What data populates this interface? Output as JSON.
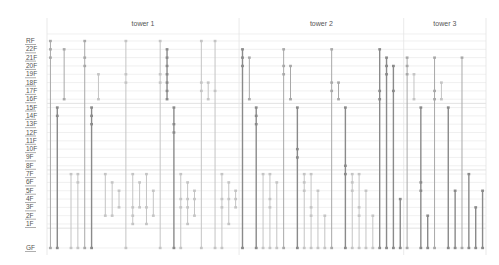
{
  "chart_data": {
    "type": "range-bar",
    "title": "",
    "xlabel": "",
    "ylabel": "",
    "y_categories": [
      "GF",
      "1F",
      "2F",
      "3F",
      "4F",
      "5F",
      "6F",
      "7F",
      "8F",
      "9F",
      "10F",
      "11F",
      "12F",
      "13F",
      "14F",
      "15F",
      "16F",
      "17F",
      "18F",
      "19F",
      "20F",
      "21F",
      "22F",
      "RF"
    ],
    "groups": [
      {
        "name": "tower 1",
        "columns": 28
      },
      {
        "name": "tower 2",
        "columns": 24
      },
      {
        "name": "tower 3",
        "columns": 12
      }
    ],
    "colors": {
      "dark": "#8a8a8a",
      "mid": "#a8a8a8",
      "light": "#c4c4c4"
    },
    "series": [
      {
        "group": 0,
        "from": 0,
        "to": 23,
        "stops": [
          22,
          21
        ],
        "tone": "mid"
      },
      {
        "group": 0,
        "from": 0,
        "to": 15,
        "stops": [
          14
        ],
        "tone": "dark"
      },
      {
        "group": 0,
        "from": 16,
        "to": 22,
        "stops": [],
        "tone": "mid"
      },
      {
        "group": 0,
        "from": 0,
        "to": 7,
        "stops": [],
        "tone": "light"
      },
      {
        "group": 0,
        "from": 0,
        "to": 7,
        "stops": [
          6
        ],
        "tone": "light"
      },
      {
        "group": 0,
        "from": 0,
        "to": 23,
        "stops": [
          21,
          20
        ],
        "tone": "mid"
      },
      {
        "group": 0,
        "from": 0,
        "to": 15,
        "stops": [
          14,
          13
        ],
        "tone": "dark"
      },
      {
        "group": 0,
        "from": 16,
        "to": 19,
        "stops": [],
        "tone": "light"
      },
      {
        "group": 0,
        "from": 2,
        "to": 7,
        "stops": [],
        "tone": "light"
      },
      {
        "group": 0,
        "from": 2,
        "to": 6,
        "stops": [],
        "tone": "light"
      },
      {
        "group": 0,
        "from": 3,
        "to": 5,
        "stops": [],
        "tone": "light"
      },
      {
        "group": 0,
        "from": 0,
        "to": 23,
        "stops": [
          19,
          18
        ],
        "tone": "light"
      },
      {
        "group": 0,
        "from": 1,
        "to": 7,
        "stops": [
          3,
          2
        ],
        "tone": "light"
      },
      {
        "group": 0,
        "from": 3,
        "to": 6,
        "stops": [],
        "tone": "light"
      },
      {
        "group": 0,
        "from": 1,
        "to": 7,
        "stops": [
          3
        ],
        "tone": "light"
      },
      {
        "group": 0,
        "from": 2,
        "to": 5,
        "stops": [],
        "tone": "light"
      },
      {
        "group": 0,
        "from": 0,
        "to": 23,
        "stops": [
          19,
          18
        ],
        "tone": "light"
      },
      {
        "group": 0,
        "from": 16,
        "to": 22,
        "stops": [
          21,
          20,
          19,
          18,
          17
        ],
        "tone": "dark"
      },
      {
        "group": 0,
        "from": 0,
        "to": 15,
        "stops": [
          13,
          12
        ],
        "tone": "dark"
      },
      {
        "group": 0,
        "from": 0,
        "to": 7,
        "stops": [
          4,
          3
        ],
        "tone": "light"
      },
      {
        "group": 0,
        "from": 1,
        "to": 6,
        "stops": [
          4,
          3
        ],
        "tone": "light"
      },
      {
        "group": 0,
        "from": 2,
        "to": 5,
        "stops": [
          4
        ],
        "tone": "light"
      },
      {
        "group": 0,
        "from": 0,
        "to": 23,
        "stops": [
          18,
          17
        ],
        "tone": "light"
      },
      {
        "group": 0,
        "from": 16,
        "to": 18,
        "stops": [],
        "tone": "light"
      },
      {
        "group": 0,
        "from": 0,
        "to": 23,
        "stops": [
          17
        ],
        "tone": "light"
      },
      {
        "group": 0,
        "from": 0,
        "to": 7,
        "stops": [
          4,
          3
        ],
        "tone": "light"
      },
      {
        "group": 0,
        "from": 1,
        "to": 6,
        "stops": [
          4
        ],
        "tone": "light"
      },
      {
        "group": 0,
        "from": 3,
        "to": 5,
        "stops": [
          4
        ],
        "tone": "light"
      },
      {
        "group": 1,
        "from": 0,
        "to": 22,
        "stops": [
          21,
          20
        ],
        "tone": "dark"
      },
      {
        "group": 1,
        "from": 16,
        "to": 21,
        "stops": [],
        "tone": "mid"
      },
      {
        "group": 1,
        "from": 0,
        "to": 15,
        "stops": [
          14,
          13
        ],
        "tone": "dark"
      },
      {
        "group": 1,
        "from": 0,
        "to": 7,
        "stops": [],
        "tone": "light"
      },
      {
        "group": 1,
        "from": 0,
        "to": 7,
        "stops": [
          4,
          3
        ],
        "tone": "light"
      },
      {
        "group": 1,
        "from": 0,
        "to": 6,
        "stops": [],
        "tone": "light"
      },
      {
        "group": 1,
        "from": 0,
        "to": 22,
        "stops": [
          20,
          19
        ],
        "tone": "mid"
      },
      {
        "group": 1,
        "from": 16,
        "to": 20,
        "stops": [],
        "tone": "mid"
      },
      {
        "group": 1,
        "from": 0,
        "to": 15,
        "stops": [
          10,
          9
        ],
        "tone": "dark"
      },
      {
        "group": 1,
        "from": 0,
        "to": 7,
        "stops": [
          6,
          5
        ],
        "tone": "light"
      },
      {
        "group": 1,
        "from": 0,
        "to": 7,
        "stops": [
          3,
          2
        ],
        "tone": "light"
      },
      {
        "group": 1,
        "from": 0,
        "to": 5,
        "stops": [],
        "tone": "light"
      },
      {
        "group": 1,
        "from": 0,
        "to": 2,
        "stops": [],
        "tone": "light"
      },
      {
        "group": 1,
        "from": 0,
        "to": 22,
        "stops": [
          18,
          17
        ],
        "tone": "mid"
      },
      {
        "group": 1,
        "from": 16,
        "to": 18,
        "stops": [],
        "tone": "mid"
      },
      {
        "group": 1,
        "from": 0,
        "to": 15,
        "stops": [
          8,
          7
        ],
        "tone": "dark"
      },
      {
        "group": 1,
        "from": 0,
        "to": 7,
        "stops": [
          6,
          5
        ],
        "tone": "light"
      },
      {
        "group": 1,
        "from": 0,
        "to": 7,
        "stops": [
          3,
          2
        ],
        "tone": "light"
      },
      {
        "group": 1,
        "from": 0,
        "to": 5,
        "stops": [],
        "tone": "light"
      },
      {
        "group": 1,
        "from": 0,
        "to": 2,
        "stops": [],
        "tone": "light"
      },
      {
        "group": 1,
        "from": 0,
        "to": 22,
        "stops": [
          17,
          16
        ],
        "tone": "dark"
      },
      {
        "group": 1,
        "from": 0,
        "to": 21,
        "stops": [
          20,
          19
        ],
        "tone": "dark"
      },
      {
        "group": 1,
        "from": 0,
        "to": 20,
        "stops": [
          17
        ],
        "tone": "dark"
      },
      {
        "group": 1,
        "from": 0,
        "to": 4,
        "stops": [],
        "tone": "dark"
      },
      {
        "group": 2,
        "from": 0,
        "to": 21,
        "stops": [
          20,
          19
        ],
        "tone": "mid"
      },
      {
        "group": 2,
        "from": 16,
        "to": 19,
        "stops": [],
        "tone": "light"
      },
      {
        "group": 2,
        "from": 0,
        "to": 15,
        "stops": [
          6,
          5
        ],
        "tone": "dark"
      },
      {
        "group": 2,
        "from": 0,
        "to": 2,
        "stops": [],
        "tone": "dark"
      },
      {
        "group": 2,
        "from": 0,
        "to": 21,
        "stops": [
          17,
          16
        ],
        "tone": "mid"
      },
      {
        "group": 2,
        "from": 16,
        "to": 18,
        "stops": [],
        "tone": "light"
      },
      {
        "group": 2,
        "from": 0,
        "to": 15,
        "stops": [],
        "tone": "dark"
      },
      {
        "group": 2,
        "from": 0,
        "to": 5,
        "stops": [],
        "tone": "dark"
      },
      {
        "group": 2,
        "from": 0,
        "to": 21,
        "stops": [],
        "tone": "mid"
      },
      {
        "group": 2,
        "from": 0,
        "to": 7,
        "stops": [],
        "tone": "dark"
      },
      {
        "group": 2,
        "from": 0,
        "to": 3,
        "stops": [],
        "tone": "dark"
      },
      {
        "group": 2,
        "from": 0,
        "to": 5,
        "stops": [],
        "tone": "dark"
      }
    ]
  }
}
